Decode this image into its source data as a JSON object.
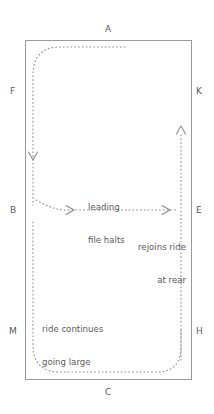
{
  "diagram": {
    "type": "dressage-arena-figure",
    "title": "",
    "arena": {
      "stroke_color": "#9a9a9a",
      "fill_color": "#ffffff",
      "left": 25,
      "top": 40,
      "right": 192,
      "bottom": 380
    },
    "path_style": {
      "color": "#8c8c8c",
      "dash": "dotted"
    },
    "markers": [
      {
        "id": "marker-a",
        "label": "A",
        "side": "top",
        "x": 108,
        "y": 30
      },
      {
        "id": "marker-f",
        "label": "F",
        "side": "left",
        "x": 13,
        "y": 92
      },
      {
        "id": "marker-b",
        "label": "B",
        "side": "left",
        "x": 13,
        "y": 211
      },
      {
        "id": "marker-m",
        "label": "M",
        "side": "left",
        "x": 13,
        "y": 332
      },
      {
        "id": "marker-k",
        "label": "K",
        "side": "right",
        "x": 199,
        "y": 92
      },
      {
        "id": "marker-e",
        "label": "E",
        "side": "right",
        "x": 199,
        "y": 211
      },
      {
        "id": "marker-h",
        "label": "H",
        "side": "right",
        "x": 199,
        "y": 332
      },
      {
        "id": "marker-c",
        "label": "C",
        "side": "bottom",
        "x": 108,
        "y": 392
      }
    ],
    "annotations": [
      {
        "id": "annotation-leading-file-halts",
        "lines": [
          "leading",
          "file halts"
        ],
        "align": "left",
        "x": 88,
        "y": 182
      },
      {
        "id": "annotation-rejoins-ride-at-rear",
        "lines": [
          "rejoins ride",
          "at rear"
        ],
        "align": "right",
        "x": 124,
        "y": 222
      },
      {
        "id": "annotation-ride-continues-going-large",
        "lines": [
          "ride continues",
          "going large"
        ],
        "align": "left",
        "x": 42,
        "y": 303
      }
    ],
    "arrows": [
      {
        "id": "arrow-down-left-track",
        "direction": "down",
        "x": 33,
        "y": 158
      },
      {
        "id": "arrow-right-centerline-1",
        "direction": "right",
        "x": 72,
        "y": 210
      },
      {
        "id": "arrow-right-centerline-2",
        "direction": "right",
        "x": 168,
        "y": 210
      },
      {
        "id": "arrow-up-right-track",
        "direction": "up",
        "x": 181,
        "y": 128
      }
    ]
  }
}
